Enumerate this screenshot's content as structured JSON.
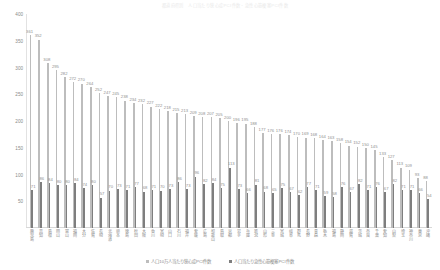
{
  "top_note": "都道府県別　人口当たり狭心症PCI件数・急性心筋梗塞PCI件数",
  "legend": {
    "position": "bottom",
    "items": [
      {
        "label": "人口10万人当たり狭心症PCI件数",
        "color": "#bdbdbd",
        "name": "series-1"
      },
      {
        "label": "人口当たり急性心筋梗塞PCI件数",
        "color": "#7e7e7e",
        "name": "series-2"
      }
    ]
  },
  "chart_data": {
    "type": "bar",
    "title": "都道府県別　人口当たり狭心症PCI件数・急性心筋梗塞PCI件数",
    "xlabel": "",
    "ylabel": "",
    "ylim": [
      0,
      400
    ],
    "yticks": [
      0,
      50,
      100,
      150,
      200,
      250,
      300,
      350,
      400
    ],
    "ytick_labels": [
      "0",
      "50",
      "100",
      "150",
      "200",
      "250",
      "300",
      "350",
      "400"
    ],
    "grid": false,
    "legend_position": "bottom",
    "categories": [
      "鹿児島",
      "高知",
      "島根",
      "岡山",
      "富山",
      "福岡",
      "大分",
      "佐賀",
      "長崎",
      "北海道",
      "熊本",
      "徳島",
      "秋田",
      "大阪",
      "香川",
      "宮崎",
      "山口",
      "石川",
      "福井",
      "愛媛",
      "広島",
      "和歌山",
      "鳥取",
      "京都",
      "岩手",
      "兵庫",
      "新潟",
      "山形",
      "三重",
      "宮城",
      "岐阜",
      "群馬",
      "長野",
      "青森",
      "栃木",
      "福島",
      "静岡",
      "滋賀",
      "茨城",
      "奈良",
      "千葉",
      "愛知",
      "山梨",
      "埼玉",
      "神奈川",
      "東京",
      "沖縄"
    ],
    "series": [
      {
        "name": "人口10万人当たり狭心症PCI件数",
        "color": "#bdbdbd",
        "values": [
          361,
          352,
          308,
          295,
          282,
          272,
          270,
          264,
          252,
          247,
          245,
          238,
          234,
          232,
          227,
          222,
          218,
          215,
          213,
          209,
          208,
          207,
          205,
          200,
          196,
          195,
          188,
          177,
          176,
          176,
          174,
          170,
          169,
          168,
          164,
          163,
          158,
          154,
          152,
          150,
          145,
          133,
          127,
          113,
          109,
          93,
          88
        ]
      },
      {
        "name": "人口当たり急性心筋梗塞PCI件数",
        "color": "#7e7e7e",
        "values": [
          71,
          86,
          84,
          80,
          80,
          84,
          74,
          80,
          57,
          70,
          73,
          71,
          77,
          68,
          71,
          70,
          73,
          86,
          73,
          96,
          82,
          84,
          75,
          113,
          73,
          66,
          81,
          68,
          65,
          75,
          67,
          62,
          77,
          71,
          59,
          58,
          76,
          67,
          82,
          71,
          76,
          67,
          82,
          71,
          71,
          66,
          54
        ]
      }
    ]
  }
}
